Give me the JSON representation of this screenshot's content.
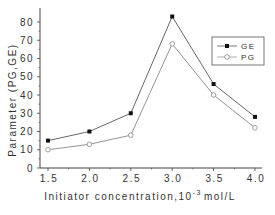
{
  "chart_data": {
    "type": "line",
    "title": "",
    "xlabel": "Initiator concentration,10^-3 mol/L",
    "xlabel_parts": {
      "main": "Initiator concentration,10",
      "sup": "-3",
      "unit": "mol/L"
    },
    "ylabel": "Parameter (PG,GE)",
    "x": [
      1.5,
      2.0,
      2.5,
      3.0,
      3.5,
      4.0
    ],
    "x_tick_labels": [
      "1.5",
      "2.0",
      "2.5",
      "3.0",
      "3.5",
      "4.0"
    ],
    "y_tick_labels": [
      "0",
      "10",
      "20",
      "30",
      "40",
      "50",
      "60",
      "70",
      "80"
    ],
    "xlim": [
      1.45,
      4.1
    ],
    "ylim": [
      0,
      87
    ],
    "grid": false,
    "legend_position": "upper right",
    "series": [
      {
        "name": "GE",
        "marker": "filled-square",
        "color": "#555555",
        "values": [
          15,
          20,
          30,
          83,
          46,
          28
        ]
      },
      {
        "name": "PG",
        "marker": "open-circle",
        "color": "#888888",
        "values": [
          10,
          13,
          18,
          68,
          40,
          22
        ]
      }
    ]
  }
}
